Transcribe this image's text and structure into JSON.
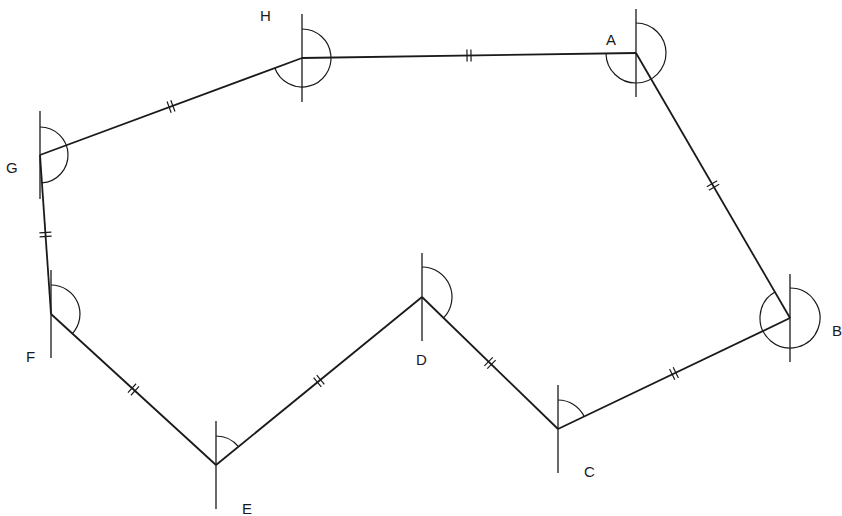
{
  "diagram": {
    "type": "polygon-traverse",
    "stroke_color": "#1a1a1a",
    "background": "#ffffff",
    "vertices": [
      {
        "id": "A",
        "label": "A",
        "x": 636,
        "y": 53,
        "label_x": 606,
        "label_y": 32
      },
      {
        "id": "B",
        "label": "B",
        "x": 790,
        "y": 318,
        "label_x": 832,
        "label_y": 323
      },
      {
        "id": "C",
        "label": "C",
        "x": 558,
        "y": 429,
        "label_x": 584,
        "label_y": 464
      },
      {
        "id": "D",
        "label": "D",
        "x": 422,
        "y": 297,
        "label_x": 416,
        "label_y": 352
      },
      {
        "id": "E",
        "label": "E",
        "x": 216,
        "y": 465,
        "label_x": 242,
        "label_y": 501
      },
      {
        "id": "F",
        "label": "F",
        "x": 51,
        "y": 314,
        "label_x": 26,
        "label_y": 349
      },
      {
        "id": "G",
        "label": "G",
        "x": 40,
        "y": 155,
        "label_x": 6,
        "label_y": 160
      },
      {
        "id": "H",
        "label": "H",
        "x": 302,
        "y": 58,
        "label_x": 260,
        "label_y": 8
      }
    ],
    "edges": [
      {
        "from": "H",
        "to": "A",
        "equal_marks": 2
      },
      {
        "from": "A",
        "to": "B",
        "equal_marks": 2
      },
      {
        "from": "B",
        "to": "C",
        "equal_marks": 2
      },
      {
        "from": "C",
        "to": "D",
        "equal_marks": 2
      },
      {
        "from": "D",
        "to": "E",
        "equal_marks": 2
      },
      {
        "from": "E",
        "to": "F",
        "equal_marks": 2
      },
      {
        "from": "F",
        "to": "G",
        "equal_marks": 2
      },
      {
        "from": "G",
        "to": "H",
        "equal_marks": 2
      }
    ],
    "angle_arcs": [
      {
        "vertex": "A",
        "radius": 30,
        "description": "clockwise arc from north meridian to line AB"
      },
      {
        "vertex": "B",
        "radius": 30,
        "description": "clockwise arc from north meridian to line BC"
      },
      {
        "vertex": "C",
        "radius": 29,
        "description": "clockwise arc from north meridian to line CD"
      },
      {
        "vertex": "D",
        "radius": 30,
        "description": "clockwise arc from north meridian to line DE"
      },
      {
        "vertex": "E",
        "radius": 29,
        "description": "clockwise arc from north meridian to line EF"
      },
      {
        "vertex": "F",
        "radius": 29,
        "description": "clockwise arc from north meridian to line FG"
      },
      {
        "vertex": "G",
        "radius": 28,
        "description": "clockwise arc from north meridian to line GH"
      },
      {
        "vertex": "H",
        "radius": 29,
        "description": "clockwise arc from north meridian to line HA"
      }
    ]
  }
}
